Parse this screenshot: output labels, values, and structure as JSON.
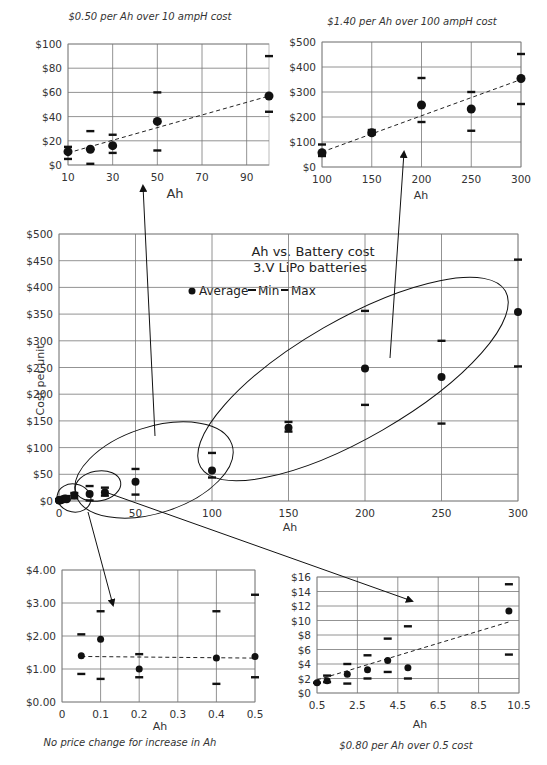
{
  "chart_data": [
    {
      "id": "top_left",
      "type": "scatter",
      "title": "$0.50 per Ah over 10 ampH cost",
      "xlabel": "Ah",
      "ylabel": "",
      "xlim": [
        10,
        100
      ],
      "ylim": [
        0,
        100
      ],
      "xticks": [
        "10",
        "30",
        "50",
        "70",
        "90"
      ],
      "yticks": [
        "$0",
        "$20",
        "$40",
        "$60",
        "$80",
        "$100"
      ],
      "grid": true,
      "x": [
        10,
        20,
        30,
        50,
        100
      ],
      "series": [
        {
          "name": "Average",
          "values": [
            11,
            13,
            16,
            36,
            57
          ]
        },
        {
          "name": "Min",
          "values": [
            5,
            1,
            10,
            12,
            44
          ]
        },
        {
          "name": "Max",
          "values": [
            15,
            28,
            25,
            60,
            90
          ]
        }
      ],
      "trendline": {
        "style": "dashed",
        "from": [
          10,
          10
        ],
        "to": [
          100,
          57
        ]
      }
    },
    {
      "id": "top_right",
      "type": "scatter",
      "title": "$1.40 per Ah over 100 ampH cost",
      "xlabel": "Ah",
      "ylabel": "",
      "xlim": [
        100,
        300
      ],
      "ylim": [
        0,
        500
      ],
      "xticks": [
        "100",
        "150",
        "200",
        "250",
        "300"
      ],
      "yticks": [
        "$0",
        "$100",
        "$200",
        "$300",
        "$400",
        "$500"
      ],
      "grid": true,
      "x": [
        100,
        150,
        200,
        250,
        300
      ],
      "series": [
        {
          "name": "Average",
          "values": [
            57,
            137,
            248,
            232,
            354
          ]
        },
        {
          "name": "Min",
          "values": [
            44,
            130,
            180,
            145,
            252
          ]
        },
        {
          "name": "Max",
          "values": [
            90,
            148,
            356,
            300,
            452
          ]
        }
      ],
      "trendline": {
        "style": "dashed",
        "from": [
          100,
          60
        ],
        "to": [
          300,
          350
        ]
      }
    },
    {
      "id": "main",
      "type": "scatter",
      "title": "Ah vs. Battery cost",
      "subtitle": "3.V LiPo batteries",
      "xlabel": "Ah",
      "ylabel": "Cost per unit",
      "xlim": [
        0,
        300
      ],
      "ylim": [
        0,
        500
      ],
      "xticks": [
        "0",
        "50",
        "100",
        "150",
        "200",
        "250",
        "300"
      ],
      "yticks": [
        "$0",
        "$50",
        "$100",
        "$150",
        "$200",
        "$250",
        "$300",
        "$350",
        "$400",
        "$450",
        "$500"
      ],
      "grid": true,
      "legend": [
        "Average",
        "Min",
        "Max"
      ],
      "legend_position": "top-center",
      "x": [
        0.05,
        0.1,
        0.2,
        0.4,
        0.5,
        1,
        2,
        3,
        4,
        5,
        10,
        20,
        30,
        50,
        100,
        150,
        200,
        250,
        300
      ],
      "series": [
        {
          "name": "Average",
          "values": [
            1.4,
            1.9,
            1.0,
            1.3,
            1.4,
            1.6,
            2.6,
            3.3,
            4.5,
            3.5,
            11,
            13,
            16,
            36,
            57,
            137,
            248,
            232,
            354
          ]
        },
        {
          "name": "Min",
          "values": [
            0.85,
            0.7,
            0.75,
            0.55,
            0.75,
            1.5,
            1.3,
            2.0,
            2.9,
            2.0,
            5,
            1,
            10,
            12,
            44,
            130,
            180,
            145,
            252
          ]
        },
        {
          "name": "Max",
          "values": [
            2.05,
            2.75,
            1.45,
            2.75,
            3.25,
            2.4,
            4.0,
            5.2,
            7.5,
            9.2,
            15,
            28,
            25,
            60,
            90,
            148,
            356,
            300,
            452
          ]
        }
      ],
      "annotations": [
        "ellipse around 0-0.5 Ah",
        "ellipse around 0.5-10 Ah",
        "ellipse around 10-100 Ah",
        "ellipse around 100-300 Ah"
      ]
    },
    {
      "id": "bottom_left",
      "type": "scatter",
      "title": "No price change for increase in Ah",
      "xlabel": "Ah",
      "ylabel": "",
      "xlim": [
        0,
        0.5
      ],
      "ylim": [
        0,
        4
      ],
      "xticks": [
        "0",
        "0.1",
        "0.2",
        "0.3",
        "0.4",
        "0.5"
      ],
      "yticks": [
        "$0.00",
        "$1.00",
        "$2.00",
        "$3.00",
        "$4.00"
      ],
      "grid": true,
      "x": [
        0.05,
        0.1,
        0.2,
        0.4,
        0.5
      ],
      "series": [
        {
          "name": "Average",
          "values": [
            1.4,
            1.9,
            1.0,
            1.33,
            1.38
          ]
        },
        {
          "name": "Min",
          "values": [
            0.85,
            0.7,
            0.75,
            0.55,
            0.75
          ]
        },
        {
          "name": "Max",
          "values": [
            2.05,
            2.75,
            1.45,
            2.75,
            3.25
          ]
        }
      ],
      "trendline": {
        "style": "dashed",
        "from": [
          0.05,
          1.38
        ],
        "to": [
          0.5,
          1.33
        ]
      }
    },
    {
      "id": "bottom_right",
      "type": "scatter",
      "title": "$0.80 per Ah over 0.5 cost",
      "xlabel": "Ah",
      "ylabel": "",
      "xlim": [
        0.5,
        10.5
      ],
      "ylim": [
        0,
        16
      ],
      "xticks": [
        "0.5",
        "2.5",
        "4.5",
        "6.5",
        "8.5",
        "10.5"
      ],
      "yticks": [
        "$0",
        "$2",
        "$4",
        "$6",
        "$8",
        "$10",
        "$12",
        "$14",
        "$16"
      ],
      "grid": true,
      "x": [
        0.5,
        1,
        2,
        3,
        4,
        5,
        10
      ],
      "series": [
        {
          "name": "Average",
          "values": [
            1.4,
            1.7,
            2.6,
            3.2,
            4.5,
            3.5,
            11.3
          ]
        },
        {
          "name": "Min",
          "values": [
            1.4,
            1.5,
            1.3,
            2.0,
            2.9,
            2.0,
            5.3
          ]
        },
        {
          "name": "Max",
          "values": [
            1.4,
            2.4,
            4.0,
            5.2,
            7.5,
            9.2,
            15.0
          ]
        }
      ],
      "trendline": {
        "style": "dashed",
        "from": [
          0.5,
          1.8
        ],
        "to": [
          10,
          9.8
        ]
      }
    }
  ],
  "labels": {
    "top_left_title": "$0.50 per Ah over 10 ampH cost",
    "top_right_title": "$1.40 per Ah over 100 ampH cost",
    "main_title": "Ah vs. Battery cost",
    "main_subtitle": "3.V LiPo batteries",
    "legend_average": "Average",
    "legend_min": "Min",
    "legend_max": "Max",
    "main_ylabel": "Cost per unit",
    "xlabel": "Ah",
    "bottom_left_caption": "No price change for increase in Ah",
    "bottom_right_caption": "$0.80 per Ah over 0.5 cost"
  }
}
